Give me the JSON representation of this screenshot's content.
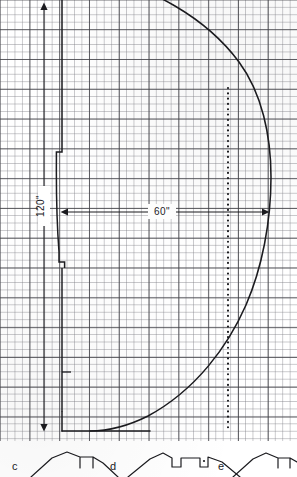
{
  "figure": {
    "medium": "graph-paper-technical-drawing",
    "ink_color": "#1b1b1f",
    "grid_color": "#787880",
    "grid_major_color": "#3c3c42",
    "paper_color": "#ffffff"
  },
  "dimensions": {
    "horizontal": {
      "label": "60\"",
      "name": "width-dimension",
      "value": 60,
      "unit": "inch",
      "from_x": 62,
      "to_x": 268,
      "y": 212
    },
    "vertical": {
      "label": "120\"",
      "name": "height-dimension",
      "value": 120,
      "unit": "inch",
      "x": 44,
      "from_y": 6,
      "to_y": 430
    }
  },
  "elements": {
    "main_profile_name": "dome-profile-curve",
    "left_wall_name": "left-wall-profile",
    "centerline_name": "dotted-centerline",
    "baseline_name": "base-line"
  },
  "subfigures": [
    {
      "id": "c",
      "label": "c",
      "name": "subfigure-c"
    },
    {
      "id": "d",
      "label": "d",
      "name": "subfigure-d"
    },
    {
      "id": "e",
      "label": "e",
      "name": "subfigure-e"
    }
  ]
}
